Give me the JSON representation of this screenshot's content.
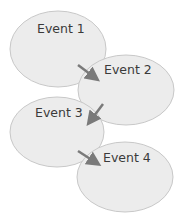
{
  "diagram": {
    "type": "sequence-flow",
    "colors": {
      "node_fill": "#ececec",
      "node_stroke": "#c8c8c8",
      "arrow": "#7a7a7a",
      "text": "#3a3a3a"
    },
    "nodes": [
      {
        "id": "e1",
        "label": "Event 1"
      },
      {
        "id": "e2",
        "label": "Event 2"
      },
      {
        "id": "e3",
        "label": "Event 3"
      },
      {
        "id": "e4",
        "label": "Event 4"
      }
    ],
    "edges": [
      {
        "from": "e1",
        "to": "e2"
      },
      {
        "from": "e2",
        "to": "e3"
      },
      {
        "from": "e3",
        "to": "e4"
      }
    ]
  }
}
